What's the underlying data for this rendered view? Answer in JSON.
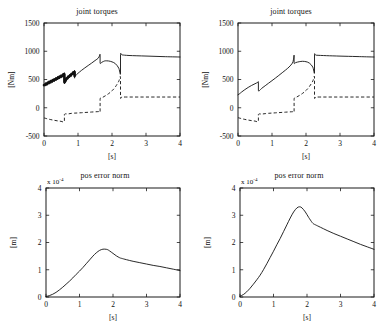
{
  "figure": {
    "background": "#ffffff",
    "ink": "#111111",
    "layout": "2x2 grid of line plots"
  },
  "chart_data": [
    {
      "id": "torques-left",
      "type": "line",
      "title": "joint torques",
      "xlabel": "[s]",
      "ylabel": "[Nm]",
      "xlim": [
        0,
        4
      ],
      "ylim": [
        -500,
        1500
      ],
      "xticks": [
        0,
        1,
        2,
        3,
        4
      ],
      "yticks": [
        -500,
        0,
        500,
        1000,
        1500
      ],
      "xticklabels": [
        "0",
        "1",
        "2",
        "3",
        "4"
      ],
      "yticklabels": [
        "-500",
        "0",
        "500",
        "1000",
        "1500"
      ],
      "grid": false,
      "legend": "none",
      "series": [
        {
          "name": "joint 1 torque",
          "style": "solid",
          "note": "thick chattering band from t=0 to t=0.9",
          "x": [
            0,
            0.05,
            0.1,
            0.15,
            0.2,
            0.25,
            0.3,
            0.35,
            0.4,
            0.45,
            0.5,
            0.55,
            0.6,
            0.6,
            0.65,
            0.7,
            0.75,
            0.8,
            0.85,
            0.9,
            0.9,
            0.95,
            1.0,
            1.1,
            1.2,
            1.3,
            1.4,
            1.5,
            1.6,
            1.63,
            1.65,
            1.65,
            1.7,
            1.75,
            1.8,
            1.9,
            2.0,
            2.1,
            2.2,
            2.25,
            2.25,
            2.3,
            2.5,
            3.0,
            3.5,
            4.0
          ],
          "y": [
            400,
            415,
            430,
            448,
            462,
            478,
            492,
            508,
            524,
            540,
            556,
            572,
            588,
            455,
            500,
            535,
            560,
            585,
            610,
            632,
            560,
            582,
            610,
            660,
            705,
            748,
            790,
            835,
            880,
            920,
            940,
            790,
            805,
            820,
            830,
            828,
            812,
            780,
            700,
            600,
            940,
            935,
            925,
            915,
            905,
            898
          ]
        },
        {
          "name": "joint 2 torque",
          "style": "dashed",
          "x": [
            0,
            0.1,
            0.2,
            0.3,
            0.4,
            0.5,
            0.6,
            0.6,
            0.7,
            0.8,
            0.9,
            1.0,
            1.1,
            1.2,
            1.3,
            1.4,
            1.5,
            1.6,
            1.62,
            1.65,
            1.65,
            1.7,
            1.8,
            1.9,
            2.0,
            2.1,
            2.2,
            2.25,
            2.25,
            2.3,
            2.6,
            3.0,
            3.5,
            4.0
          ],
          "y": [
            -180,
            -196,
            -210,
            -222,
            -232,
            -240,
            -245,
            -120,
            -110,
            -100,
            -95,
            -92,
            -88,
            -84,
            -80,
            -76,
            -72,
            -68,
            -66,
            -64,
            150,
            175,
            210,
            250,
            300,
            370,
            470,
            540,
            190,
            190,
            190,
            190,
            190,
            190
          ]
        }
      ]
    },
    {
      "id": "torques-right",
      "type": "line",
      "title": "joint torques",
      "xlabel": "[s]",
      "ylabel": "[Nm]",
      "xlim": [
        0,
        4
      ],
      "ylim": [
        -500,
        1500
      ],
      "xticks": [
        0,
        1,
        2,
        3,
        4
      ],
      "yticks": [
        -500,
        0,
        500,
        1000,
        1500
      ],
      "xticklabels": [
        "0",
        "1",
        "2",
        "3",
        "4"
      ],
      "yticklabels": [
        "-500",
        "0",
        "500",
        "1000",
        "1500"
      ],
      "grid": false,
      "legend": "none",
      "series": [
        {
          "name": "joint 1 torque",
          "style": "solid",
          "note": "smooth, no chattering",
          "x": [
            0,
            0.05,
            0.1,
            0.2,
            0.3,
            0.4,
            0.5,
            0.58,
            0.6,
            0.6,
            0.7,
            0.8,
            0.9,
            1.0,
            1.1,
            1.2,
            1.3,
            1.4,
            1.5,
            1.6,
            1.63,
            1.65,
            1.65,
            1.7,
            1.8,
            1.9,
            2.0,
            2.1,
            2.2,
            2.25,
            2.25,
            2.3,
            2.6,
            3.0,
            3.5,
            4.0
          ],
          "y": [
            230,
            250,
            275,
            320,
            360,
            395,
            425,
            448,
            452,
            300,
            345,
            390,
            435,
            480,
            525,
            572,
            620,
            668,
            720,
            790,
            850,
            930,
            790,
            800,
            815,
            822,
            815,
            790,
            720,
            615,
            935,
            930,
            922,
            914,
            906,
            898
          ]
        },
        {
          "name": "joint 2 torque",
          "style": "dashed",
          "x": [
            0,
            0.1,
            0.2,
            0.3,
            0.4,
            0.5,
            0.6,
            0.6,
            0.7,
            0.8,
            0.9,
            1.0,
            1.1,
            1.2,
            1.3,
            1.4,
            1.5,
            1.6,
            1.62,
            1.65,
            1.65,
            1.7,
            1.8,
            1.9,
            2.0,
            2.1,
            2.2,
            2.25,
            2.25,
            2.3,
            2.6,
            3.0,
            3.5,
            4.0
          ],
          "y": [
            -175,
            -192,
            -206,
            -218,
            -228,
            -236,
            -242,
            -120,
            -112,
            -104,
            -98,
            -94,
            -90,
            -86,
            -82,
            -78,
            -74,
            -70,
            -68,
            -66,
            150,
            180,
            215,
            255,
            305,
            375,
            472,
            545,
            190,
            190,
            190,
            190,
            190,
            190
          ]
        }
      ]
    },
    {
      "id": "poserr-left",
      "type": "line",
      "title": "pos error norm",
      "xlabel": "[s]",
      "ylabel": "[m]",
      "y_multiplier": "x 10",
      "y_multiplier_exp": "-4",
      "xlim": [
        0,
        4
      ],
      "ylim": [
        0,
        4
      ],
      "xticks": [
        0,
        1,
        2,
        3,
        4
      ],
      "yticks": [
        0,
        1,
        2,
        3,
        4
      ],
      "xticklabels": [
        "0",
        "1",
        "2",
        "3",
        "4"
      ],
      "yticklabels": [
        "0",
        "1",
        "2",
        "3",
        "4"
      ],
      "grid": false,
      "legend": "none",
      "series": [
        {
          "name": "position error norm",
          "style": "solid",
          "peak_value": 1.75,
          "peak_time": 1.8,
          "x": [
            0,
            0.1,
            0.2,
            0.3,
            0.4,
            0.5,
            0.6,
            0.7,
            0.8,
            0.9,
            1.0,
            1.1,
            1.2,
            1.3,
            1.4,
            1.5,
            1.6,
            1.7,
            1.8,
            1.85,
            1.9,
            2.0,
            2.1,
            2.2,
            2.25,
            2.4,
            2.6,
            2.8,
            3.0,
            3.2,
            3.4,
            3.6,
            3.8,
            4.0
          ],
          "y": [
            0.02,
            0.05,
            0.1,
            0.17,
            0.26,
            0.36,
            0.47,
            0.58,
            0.7,
            0.83,
            0.95,
            1.08,
            1.22,
            1.36,
            1.5,
            1.62,
            1.71,
            1.755,
            1.75,
            1.73,
            1.69,
            1.6,
            1.51,
            1.44,
            1.42,
            1.37,
            1.31,
            1.26,
            1.21,
            1.16,
            1.12,
            1.07,
            1.02,
            0.97
          ]
        }
      ]
    },
    {
      "id": "poserr-right",
      "type": "line",
      "title": "pos error norm",
      "xlabel": "[s]",
      "ylabel": "[m]",
      "y_multiplier": "x 10",
      "y_multiplier_exp": "-4",
      "xlim": [
        0,
        4
      ],
      "ylim": [
        0,
        4
      ],
      "xticks": [
        0,
        1,
        2,
        3,
        4
      ],
      "yticks": [
        0,
        1,
        2,
        3,
        4
      ],
      "xticklabels": [
        "0",
        "1",
        "2",
        "3",
        "4"
      ],
      "yticklabels": [
        "0",
        "1",
        "2",
        "3",
        "4"
      ],
      "grid": false,
      "legend": "none",
      "series": [
        {
          "name": "position error norm",
          "style": "solid",
          "peak_value": 3.3,
          "peak_time": 1.8,
          "x": [
            0,
            0.1,
            0.2,
            0.3,
            0.4,
            0.5,
            0.6,
            0.7,
            0.8,
            0.9,
            1.0,
            1.1,
            1.2,
            1.3,
            1.4,
            1.5,
            1.6,
            1.7,
            1.78,
            1.85,
            1.95,
            2.05,
            2.15,
            2.2,
            2.25,
            2.4,
            2.6,
            2.8,
            3.0,
            3.2,
            3.4,
            3.6,
            3.8,
            4.0
          ],
          "y": [
            0.03,
            0.09,
            0.19,
            0.32,
            0.47,
            0.63,
            0.8,
            1.0,
            1.22,
            1.45,
            1.68,
            1.92,
            2.15,
            2.4,
            2.65,
            2.9,
            3.12,
            3.27,
            3.31,
            3.27,
            3.12,
            2.92,
            2.74,
            2.68,
            2.65,
            2.56,
            2.44,
            2.33,
            2.23,
            2.13,
            2.03,
            1.93,
            1.84,
            1.75
          ]
        }
      ]
    }
  ]
}
